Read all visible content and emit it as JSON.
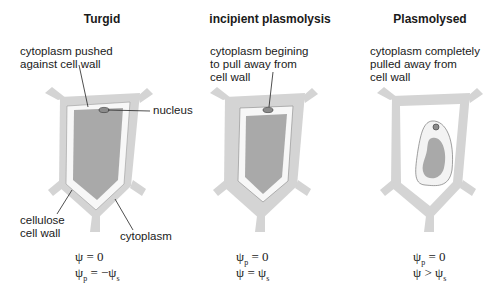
{
  "panels": [
    {
      "title": "Turgid",
      "description": "cytoplasm pushed\nagainst cell wall",
      "labels": {
        "nucleus": "nucleus",
        "cell_wall": "cellulose\ncell wall",
        "cytoplasm": "cytoplasm"
      },
      "equations": {
        "line1": {
          "lhs": "ψ",
          "lhs_sub": "",
          "op": "= 0",
          "rhs": "",
          "rhs_sub": ""
        },
        "line2": {
          "lhs": "ψ",
          "lhs_sub": "p",
          "op": "= −ψ",
          "rhs_sub": "s"
        }
      }
    },
    {
      "title": "incipient plasmolysis",
      "description": "cytoplasm begining\nto pull away from\ncell wall",
      "equations": {
        "line1": {
          "lhs": "ψ",
          "lhs_sub": "p",
          "op": "= 0"
        },
        "line2": {
          "lhs": "ψ",
          "lhs_sub": "",
          "op": "= ψ",
          "rhs_sub": "s"
        }
      }
    },
    {
      "title": "Plasmolysed",
      "description": "cytoplasm completely\npulled away from\ncell wall",
      "equations": {
        "line1": {
          "lhs": "ψ",
          "lhs_sub": "p",
          "op": "= 0"
        },
        "line2": {
          "lhs": "ψ",
          "lhs_sub": "",
          "op": "> ψ",
          "rhs_sub": "s"
        }
      }
    }
  ],
  "colors": {
    "cell_wall": "#d4d4d4",
    "membrane_space": "#f2f2f2",
    "vacuole": "#a9a9a9",
    "nucleus": "#8c8c8c",
    "line": "#222222"
  }
}
